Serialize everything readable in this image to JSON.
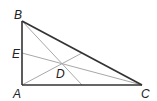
{
  "diagram": {
    "colors": {
      "edge": "#333333",
      "cevian": "#a8a8a8",
      "label": "#222222"
    },
    "points": {
      "A": {
        "label": "A",
        "x": 22,
        "y": 85
      },
      "B": {
        "label": "B",
        "x": 22,
        "y": 21
      },
      "C": {
        "label": "C",
        "x": 142,
        "y": 85
      },
      "D": {
        "label": "D",
        "x": 61,
        "y": 64
      },
      "E": {
        "label": "E",
        "x": 22,
        "y": 53
      }
    },
    "edges": [
      "AB",
      "BC",
      "CA"
    ],
    "cevians": [
      "B to AC",
      "E to C",
      "A to BC"
    ]
  }
}
